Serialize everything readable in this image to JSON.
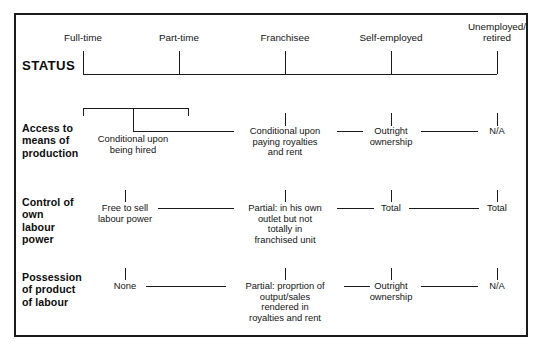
{
  "figure": {
    "type": "matrix-diagram",
    "border_color": "#1b1b1b",
    "background": "#ffffff",
    "text_color": "#141414"
  },
  "columns": [
    {
      "id": "full-time",
      "label": "Full-time",
      "x": 83
    },
    {
      "id": "part-time",
      "label": "Part-time",
      "x": 179
    },
    {
      "id": "franchisee",
      "label": "Franchisee",
      "x": 285
    },
    {
      "id": "self-employed",
      "label": "Self-employed",
      "x": 391
    },
    {
      "id": "unemployed-retired",
      "label": "Unemployed/\nretired",
      "x": 497
    }
  ],
  "rows": [
    {
      "id": "status",
      "label": "STATUS",
      "style": "heading"
    },
    {
      "id": "access-to-means-of-production",
      "label": "Access to\nmeans of\nproduction",
      "cells": [
        {
          "column": "full-time-part-time",
          "text": "Conditional upon\nbeing hired",
          "x": 133
        },
        {
          "column": "franchisee",
          "text": "Conditional upon\npaying royalties\nand rent",
          "x": 285
        },
        {
          "column": "self-employed",
          "text": "Outright\nownership",
          "x": 391
        },
        {
          "column": "unemployed-retired",
          "text": "N/A",
          "x": 497
        }
      ]
    },
    {
      "id": "control-of-own-labour-power",
      "label": "Control  of\nown\nlabour\npower",
      "cells": [
        {
          "column": "full-time",
          "text": "Free to sell\nlabour power",
          "x": 125
        },
        {
          "column": "franchisee",
          "text": "Partial: in his own\noutlet but not\ntotally in\nfranchised unit",
          "x": 285
        },
        {
          "column": "self-employed",
          "text": "Total",
          "x": 391
        },
        {
          "column": "unemployed-retired",
          "text": "Total",
          "x": 497
        }
      ]
    },
    {
      "id": "possession-of-product-of-labour",
      "label": "Possession\nof product\nof labour",
      "cells": [
        {
          "column": "full-time",
          "text": "None",
          "x": 125
        },
        {
          "column": "franchisee",
          "text": "Partial: proprtion of\noutput/sales\nrendered in\nroyalties and rent",
          "x": 285
        },
        {
          "column": "self-employed",
          "text": "Outright\nownership",
          "x": 391
        },
        {
          "column": "unemployed-retired",
          "text": "N/A",
          "x": 497
        }
      ]
    }
  ]
}
